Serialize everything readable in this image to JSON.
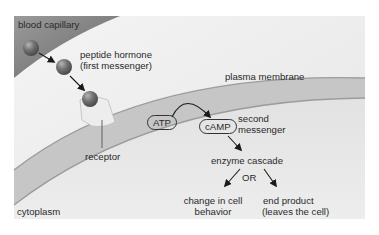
{
  "diagram": {
    "colors": {
      "background": "#f0f0f0",
      "capillary": "#8a8a8a",
      "membrane_band": "#c4c4c4",
      "membrane_edge": "#9a9a9a",
      "hormone": "#6f6f6f",
      "receptor": "#ececec",
      "text": "#2a2a2a"
    },
    "labels": {
      "blood_capillary": "blood capillary",
      "hormone_line1": "peptide hormone",
      "hormone_line2": "(first messenger)",
      "plasma_membrane": "plasma membrane",
      "receptor": "receptor",
      "cytoplasm": "cytoplasm",
      "atp": "ATP",
      "camp": "cAMP",
      "second_messenger_line1": "second",
      "second_messenger_line2": "messenger",
      "enzyme_cascade": "enzyme cascade",
      "or": "OR",
      "outcome_left_line1": "change in cell",
      "outcome_left_line2": "behavior",
      "outcome_right_line1": "end product",
      "outcome_right_line2": "(leaves the cell)"
    },
    "flow": [
      {
        "from": "blood capillary",
        "to": "peptide hormone (first messenger)"
      },
      {
        "from": "peptide hormone (first messenger)",
        "to": "receptor"
      },
      {
        "from": "ATP",
        "to": "cAMP (second messenger)"
      },
      {
        "from": "cAMP",
        "to": "enzyme cascade"
      },
      {
        "from": "enzyme cascade",
        "to": "change in cell behavior"
      },
      {
        "from": "enzyme cascade",
        "to": "end product (leaves the cell)"
      }
    ]
  }
}
